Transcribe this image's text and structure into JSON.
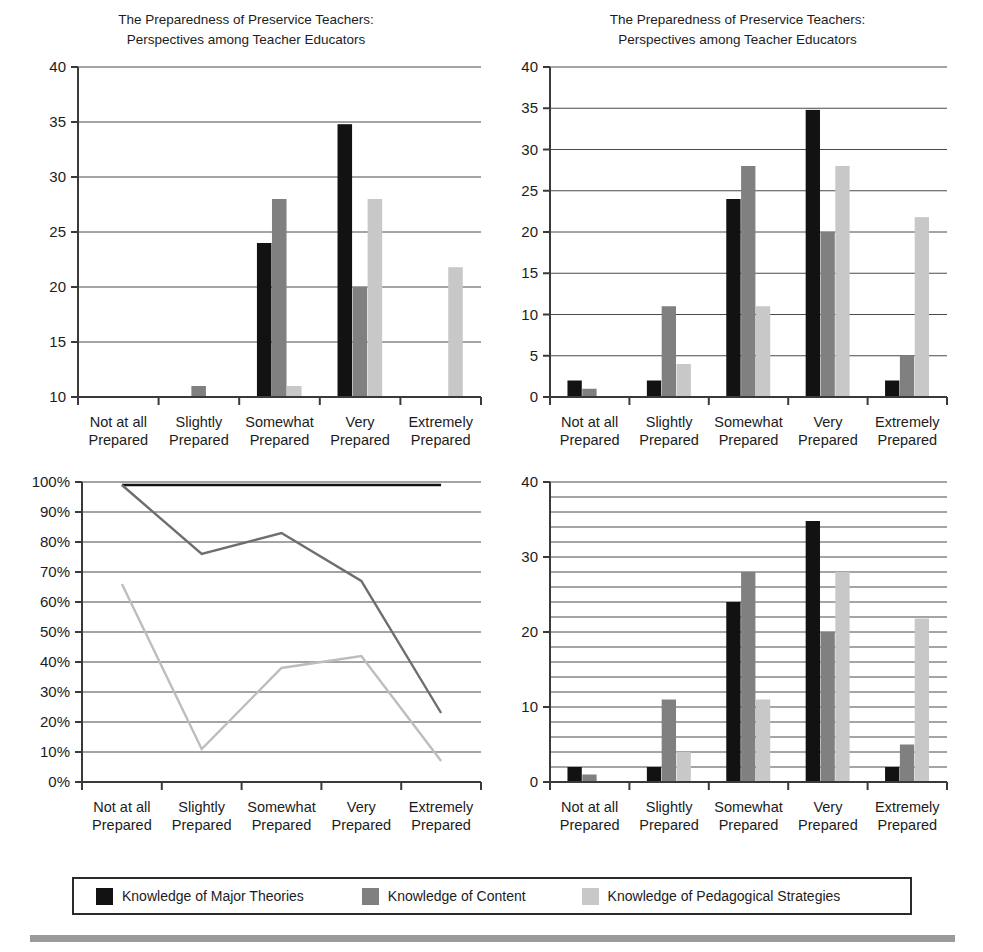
{
  "shared": {
    "title_line1": "The Preparedness of Preservice Teachers:",
    "title_line2": "Perspectives among Teacher Educators",
    "categories": [
      {
        "line1": "Not at all",
        "line2": "Prepared"
      },
      {
        "line1": "Slightly",
        "line2": "Prepared"
      },
      {
        "line1": "Somewhat",
        "line2": "Prepared"
      },
      {
        "line1": "Very",
        "line2": "Prepared"
      },
      {
        "line1": "Extremely",
        "line2": "Prepared"
      }
    ],
    "series_names": [
      "Knowledge of Major Theories",
      "Knowledge of Content",
      "Knowledge of Pedagogical Strategies"
    ],
    "colors": {
      "series_black": "#121212",
      "series_dark_gray": "#808080",
      "series_light_gray": "#c8c8c8",
      "axis": "#3a3a3a",
      "grid": "#4a4a4a",
      "text": "#1c1c1c",
      "footer_rule": "#9a9a9a"
    }
  },
  "legend": {
    "items": [
      {
        "label": "Knowledge of Major Theories",
        "color": "#121212"
      },
      {
        "label": "Knowledge of Content",
        "color": "#808080"
      },
      {
        "label": "Knowledge of Pedagogical Strategies",
        "color": "#c8c8c8"
      }
    ]
  },
  "chart_data": [
    {
      "id": "top-left",
      "type": "bar",
      "title": "The Preparedness of Preservice Teachers: Perspectives among Teacher Educators",
      "xlabel": "",
      "ylabel": "",
      "categories": [
        "Not at all Prepared",
        "Slightly Prepared",
        "Somewhat Prepared",
        "Very Prepared",
        "Extremely Prepared"
      ],
      "series": [
        {
          "name": "Knowledge of Major Theories",
          "color": "#121212",
          "values": [
            2,
            2,
            24,
            34.8,
            2
          ]
        },
        {
          "name": "Knowledge of Content",
          "color": "#808080",
          "values": [
            1,
            11,
            28,
            20,
            5
          ]
        },
        {
          "name": "Knowledge of Pedagogical Strategies",
          "color": "#c8c8c8",
          "values": [
            0,
            4,
            11,
            28,
            21.8
          ]
        }
      ],
      "ylim": [
        10,
        40
      ],
      "yticks": [
        10,
        15,
        20,
        25,
        30,
        35,
        40
      ],
      "ytick_labels": [
        "10",
        "15",
        "20",
        "25",
        "30",
        "35",
        "40"
      ],
      "grid": true,
      "note": "Y axis truncated at 10 — bars below 10 are not visible"
    },
    {
      "id": "top-right",
      "type": "bar",
      "title": "The Preparedness of Preservice Teachers: Perspectives among Teacher Educators",
      "xlabel": "",
      "ylabel": "",
      "categories": [
        "Not at all Prepared",
        "Slightly Prepared",
        "Somewhat Prepared",
        "Very Prepared",
        "Extremely Prepared"
      ],
      "series": [
        {
          "name": "Knowledge of Major Theories",
          "color": "#121212",
          "values": [
            2,
            2,
            24,
            34.8,
            2
          ]
        },
        {
          "name": "Knowledge of Content",
          "color": "#808080",
          "values": [
            1,
            11,
            28,
            20,
            5
          ]
        },
        {
          "name": "Knowledge of Pedagogical Strategies",
          "color": "#c8c8c8",
          "values": [
            0,
            4,
            11,
            28,
            21.8
          ]
        }
      ],
      "ylim": [
        0,
        40
      ],
      "yticks": [
        0,
        5,
        10,
        15,
        20,
        25,
        30,
        35,
        40
      ],
      "ytick_labels": [
        "0",
        "5",
        "10",
        "15",
        "20",
        "25",
        "30",
        "35",
        "40"
      ],
      "grid": true
    },
    {
      "id": "bottom-left",
      "type": "line",
      "title": "",
      "xlabel": "",
      "ylabel": "",
      "categories": [
        "Not at all Prepared",
        "Slightly Prepared",
        "Somewhat Prepared",
        "Very Prepared",
        "Extremely Prepared"
      ],
      "series": [
        {
          "name": "Knowledge of Major Theories",
          "color": "#121212",
          "values": [
            99,
            99,
            99,
            99,
            99
          ]
        },
        {
          "name": "Knowledge of Content",
          "color": "#6e6e6e",
          "values": [
            99,
            76,
            83,
            67,
            23
          ]
        },
        {
          "name": "Knowledge of Pedagogical Strategies",
          "color": "#bdbdbd",
          "values": [
            66,
            11,
            38,
            42,
            7
          ]
        }
      ],
      "ylim": [
        0,
        100
      ],
      "yticks": [
        0,
        10,
        20,
        30,
        40,
        50,
        60,
        70,
        80,
        90,
        100
      ],
      "ytick_labels": [
        "0%",
        "10%",
        "20%",
        "30%",
        "40%",
        "50%",
        "60%",
        "70%",
        "80%",
        "90%",
        "100%"
      ],
      "grid": true
    },
    {
      "id": "bottom-right",
      "type": "bar",
      "title": "",
      "xlabel": "",
      "ylabel": "",
      "categories": [
        "Not at all Prepared",
        "Slightly Prepared",
        "Somewhat Prepared",
        "Very Prepared",
        "Extremely Prepared"
      ],
      "series": [
        {
          "name": "Knowledge of Major Theories",
          "color": "#121212",
          "values": [
            2,
            2,
            24,
            34.8,
            2
          ]
        },
        {
          "name": "Knowledge of Content",
          "color": "#808080",
          "values": [
            1,
            11,
            28,
            20,
            5
          ]
        },
        {
          "name": "Knowledge of Pedagogical Strategies",
          "color": "#c8c8c8",
          "values": [
            0,
            4,
            11,
            28,
            21.8
          ]
        }
      ],
      "ylim": [
        0,
        40
      ],
      "yticks": [
        0,
        10,
        20,
        30,
        40
      ],
      "ytick_labels": [
        "0",
        "10",
        "20",
        "30",
        "40"
      ],
      "gridlines_every": 2,
      "grid": true
    }
  ]
}
